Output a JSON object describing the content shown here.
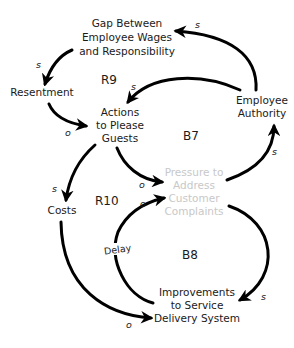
{
  "diagram": {
    "type": "causal-loop-diagram",
    "colors": {
      "ink": "#1a1a1a",
      "faded_node": "#c8c8c8",
      "background": "#ffffff"
    },
    "nodes": {
      "gap": {
        "lines": [
          "Gap Between",
          "Employee Wages",
          "and Responsibility"
        ]
      },
      "resentment": {
        "lines": [
          "Resentment"
        ]
      },
      "actions": {
        "lines": [
          "Actions",
          "to Please",
          "Guests"
        ]
      },
      "authority": {
        "lines": [
          "Employee",
          "Authority"
        ]
      },
      "pressure": {
        "lines": [
          "Pressure to",
          "Address",
          "Customer",
          "Complaints"
        ]
      },
      "costs": {
        "lines": [
          "Costs"
        ]
      },
      "improvements": {
        "lines": [
          "Improvements",
          "to Service",
          "Delivery System"
        ]
      }
    },
    "loops": {
      "r9": "R9",
      "b7": "B7",
      "r10": "R10",
      "b8": "B8"
    },
    "links": [
      {
        "from": "Employee Authority",
        "to": "Gap Between Employee Wages and Responsibility",
        "polarity": "s"
      },
      {
        "from": "Gap Between Employee Wages and Responsibility",
        "to": "Resentment",
        "polarity": "s"
      },
      {
        "from": "Resentment",
        "to": "Actions to Please Guests",
        "polarity": "o"
      },
      {
        "from": "Employee Authority",
        "to": "Actions to Please Guests",
        "polarity": "s"
      },
      {
        "from": "Actions to Please Guests",
        "to": "Pressure to Address Customer Complaints",
        "polarity": "o"
      },
      {
        "from": "Pressure to Address Customer Complaints",
        "to": "Employee Authority",
        "polarity": "s"
      },
      {
        "from": "Actions to Please Guests",
        "to": "Costs",
        "polarity": "s"
      },
      {
        "from": "Costs",
        "to": "Improvements to Service Delivery System",
        "polarity": "o"
      },
      {
        "from": "Pressure to Address Customer Complaints",
        "to": "Improvements to Service Delivery System",
        "polarity": "s"
      },
      {
        "from": "Improvements to Service Delivery System",
        "to": "Pressure to Address Customer Complaints",
        "polarity": "o",
        "delay": "Delay"
      }
    ],
    "polarity_labels": {
      "auth_gap": "s",
      "gap_res": "s",
      "res_act": "o",
      "auth_act": "s",
      "act_press": "o",
      "press_auth": "s",
      "act_costs": "s",
      "costs_impr": "o",
      "press_impr": "s",
      "impr_press": "o"
    },
    "delay_label": "Delay"
  }
}
